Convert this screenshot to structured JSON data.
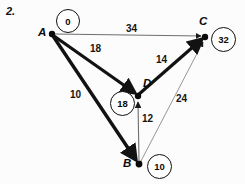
{
  "problem": {
    "number": "2."
  },
  "graph": {
    "type": "directed-weighted-graph",
    "description": "Dijkstra shortest-path diagram with four vertices A, B, C, D and distance labels in circles",
    "nodes": [
      {
        "id": "A",
        "label": "A",
        "distance": "0",
        "cx": 52,
        "cy": 34,
        "label_x": 38,
        "label_y": 28,
        "badge_cx": 67,
        "badge_cy": 20
      },
      {
        "id": "C",
        "label": "C",
        "distance": "32",
        "cx": 205,
        "cy": 37,
        "label_x": 200,
        "label_y": 17,
        "badge_cx": 223,
        "badge_cy": 38
      },
      {
        "id": "D",
        "label": "D",
        "distance": "18",
        "cx": 138,
        "cy": 96,
        "label_x": 143,
        "label_y": 79,
        "badge_cx": 121,
        "badge_cy": 102
      },
      {
        "id": "B",
        "label": "B",
        "distance": "10",
        "cx": 139,
        "cy": 164,
        "label_x": 124,
        "label_y": 159,
        "badge_cx": 158,
        "badge_cy": 165
      }
    ],
    "edges": [
      {
        "id": "A-C",
        "from": "A",
        "to": "C",
        "weight": "34",
        "emphasis": "thin",
        "label_x": 126,
        "label_y": 25
      },
      {
        "id": "A-D",
        "from": "A",
        "to": "D",
        "weight": "18",
        "emphasis": "thick",
        "label_x": 90,
        "label_y": 45
      },
      {
        "id": "A-B",
        "from": "A",
        "to": "B",
        "weight": "10",
        "emphasis": "thick",
        "label_x": 71,
        "label_y": 91
      },
      {
        "id": "D-C",
        "from": "D",
        "to": "C",
        "weight": "14",
        "emphasis": "thick",
        "label_x": 156,
        "label_y": 56
      },
      {
        "id": "B-D",
        "from": "B",
        "to": "D",
        "weight": "12",
        "emphasis": "thin",
        "label_x": 142,
        "label_y": 115
      },
      {
        "id": "B-C",
        "from": "B",
        "to": "C",
        "weight": "24",
        "emphasis": "thin",
        "label_x": 176,
        "label_y": 95
      }
    ],
    "colors": {
      "ink": "#111111",
      "thin_stroke": "#6e6e6e",
      "thick_stroke": "#121212",
      "background": "#fcfcfc"
    }
  }
}
